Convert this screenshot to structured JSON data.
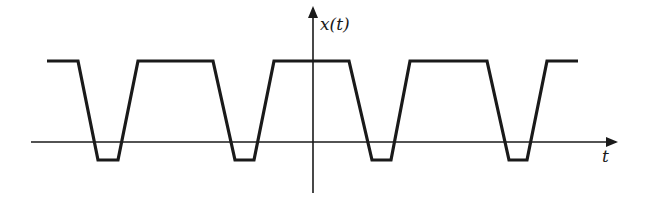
{
  "diagram": {
    "y_axis_label": "x(t)",
    "x_axis_label": "t",
    "colors": {
      "stroke": "#1a1a1a",
      "background": "#ffffff"
    },
    "axes": {
      "horizontal": {
        "x1": 31,
        "y": 142,
        "x2": 616
      },
      "vertical": {
        "x": 313,
        "y_top": 8,
        "y_bottom": 193
      }
    },
    "waveform": {
      "high_y": 61,
      "low_y": 160,
      "points": [
        [
          47,
          61
        ],
        [
          78,
          61
        ],
        [
          98,
          160
        ],
        [
          118,
          160
        ],
        [
          138,
          61
        ],
        [
          213,
          61
        ],
        [
          235,
          160
        ],
        [
          254,
          160
        ],
        [
          274,
          61
        ],
        [
          349,
          61
        ],
        [
          372,
          160
        ],
        [
          391,
          160
        ],
        [
          410,
          61
        ],
        [
          487,
          61
        ],
        [
          509,
          160
        ],
        [
          527,
          160
        ],
        [
          547,
          61
        ],
        [
          578,
          61
        ]
      ]
    }
  }
}
